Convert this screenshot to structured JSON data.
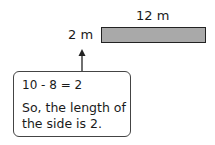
{
  "diagram": {
    "rectangle": {
      "top_label": "12 m",
      "side_label": "2 m",
      "fill_color": "#a9a9a9",
      "border_color": "#222222"
    },
    "callout": {
      "equation": "10 - 8 = 2",
      "conclusion": "So, the length of the side is 2."
    }
  }
}
